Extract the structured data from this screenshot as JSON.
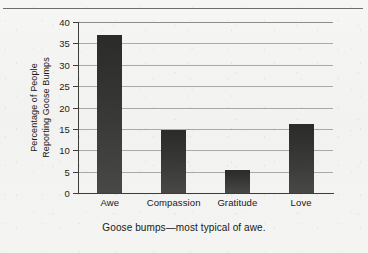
{
  "chart_data": {
    "type": "bar",
    "title": "",
    "subtitle": "",
    "categories": [
      "Awe",
      "Compassion",
      "Gratitude",
      "Love"
    ],
    "values": [
      37,
      14.8,
      5.4,
      16.2
    ],
    "xlabel": "",
    "ylabel": "Percentage of People Reporting Goose Bumps",
    "ylabel_line1": "Percentage of People",
    "ylabel_line2": "Reporting Goose Bumps",
    "ylim": [
      0,
      40
    ],
    "ytick_labels": [
      "0",
      "5",
      "10",
      "15",
      "20",
      "25",
      "30",
      "35",
      "40"
    ],
    "ytick_values": [
      0,
      5,
      10,
      15,
      20,
      25,
      30,
      35,
      40
    ],
    "grid": true,
    "grid_axis": "y",
    "legend": false,
    "legend_position": "none",
    "caption": "Goose bumps—most typical of awe.",
    "bar_color": "#35362F",
    "grid_color": "#A9AAA8",
    "axis_color": "#3C3D3B",
    "background_color": "#F3F3F1"
  },
  "figure": {
    "caption": "Goose bumps—most typical of awe.",
    "top_rule": "horizontal-rule"
  }
}
